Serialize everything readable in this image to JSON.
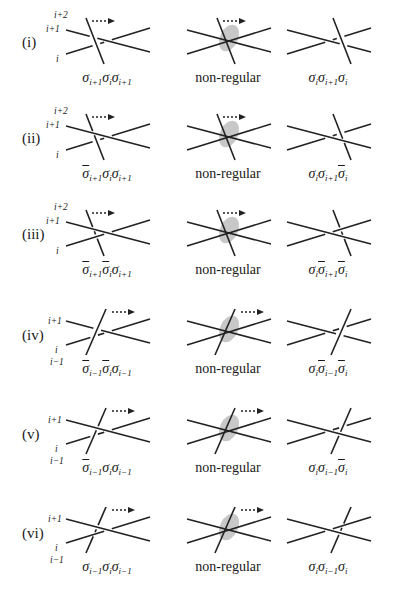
{
  "figure": {
    "columns": [
      "before",
      "non-regular",
      "after"
    ],
    "rows": [
      {
        "id": "i",
        "label": "(i)",
        "strand_labels": [
          "i+2",
          "i+1",
          "i"
        ],
        "left_word": [
          {
            "s": "σ",
            "sub": "i+1",
            "bar": false
          },
          {
            "s": "σ",
            "sub": "i",
            "bar": false
          },
          {
            "s": "σ",
            "sub": "i+1",
            "bar": false
          }
        ],
        "middle_caption": "non-regular",
        "right_word": [
          {
            "s": "σ",
            "sub": "i",
            "bar": false
          },
          {
            "s": "σ",
            "sub": "i+1",
            "bar": false
          },
          {
            "s": "σ",
            "sub": "i",
            "bar": false
          }
        ],
        "moving_strand": "descending",
        "moving_over_top": true,
        "moving_over_bottom": true
      },
      {
        "id": "ii",
        "label": "(ii)",
        "strand_labels": [
          "i+2",
          "i+1",
          "i"
        ],
        "left_word": [
          {
            "s": "σ",
            "sub": "i+1",
            "bar": true
          },
          {
            "s": "σ",
            "sub": "i",
            "bar": false
          },
          {
            "s": "σ",
            "sub": "i+1",
            "bar": false
          }
        ],
        "middle_caption": "non-regular",
        "right_word": [
          {
            "s": "σ",
            "sub": "i",
            "bar": false
          },
          {
            "s": "σ",
            "sub": "i+1",
            "bar": false
          },
          {
            "s": "σ",
            "sub": "i",
            "bar": true
          }
        ],
        "moving_strand": "descending",
        "moving_over_top": false,
        "moving_over_bottom": true
      },
      {
        "id": "iii",
        "label": "(iii)",
        "strand_labels": [
          "i+2",
          "i+1",
          "i"
        ],
        "left_word": [
          {
            "s": "σ",
            "sub": "i+1",
            "bar": true
          },
          {
            "s": "σ",
            "sub": "i",
            "bar": true
          },
          {
            "s": "σ",
            "sub": "i+1",
            "bar": false
          }
        ],
        "middle_caption": "non-regular",
        "right_word": [
          {
            "s": "σ",
            "sub": "i",
            "bar": false
          },
          {
            "s": "σ",
            "sub": "i+1",
            "bar": true
          },
          {
            "s": "σ",
            "sub": "i",
            "bar": true
          }
        ],
        "moving_strand": "descending",
        "moving_over_top": false,
        "moving_over_bottom": false
      },
      {
        "id": "iv",
        "label": "(iv)",
        "strand_labels": [
          "i+1",
          "i",
          "i−1"
        ],
        "left_word": [
          {
            "s": "σ",
            "sub": "i−1",
            "bar": true
          },
          {
            "s": "σ",
            "sub": "i",
            "bar": true
          },
          {
            "s": "σ",
            "sub": "i−1",
            "bar": false
          }
        ],
        "middle_caption": "non-regular",
        "right_word": [
          {
            "s": "σ",
            "sub": "i",
            "bar": false
          },
          {
            "s": "σ",
            "sub": "i−1",
            "bar": true
          },
          {
            "s": "σ",
            "sub": "i",
            "bar": true
          }
        ],
        "moving_strand": "ascending",
        "moving_over_top": true,
        "moving_over_bottom": true
      },
      {
        "id": "v",
        "label": "(v)",
        "strand_labels": [
          "i+1",
          "i",
          "i−1"
        ],
        "left_word": [
          {
            "s": "σ",
            "sub": "i−1",
            "bar": true
          },
          {
            "s": "σ",
            "sub": "i",
            "bar": false
          },
          {
            "s": "σ",
            "sub": "i−1",
            "bar": false
          }
        ],
        "middle_caption": "non-regular",
        "right_word": [
          {
            "s": "σ",
            "sub": "i",
            "bar": false
          },
          {
            "s": "σ",
            "sub": "i−1",
            "bar": false
          },
          {
            "s": "σ",
            "sub": "i",
            "bar": true
          }
        ],
        "moving_strand": "ascending",
        "moving_over_top": false,
        "moving_over_bottom": true
      },
      {
        "id": "vi",
        "label": "(vi)",
        "strand_labels": [
          "i+1",
          "i",
          "i−1"
        ],
        "left_word": [
          {
            "s": "σ",
            "sub": "i−1",
            "bar": false
          },
          {
            "s": "σ",
            "sub": "i",
            "bar": false
          },
          {
            "s": "σ",
            "sub": "i−1",
            "bar": false
          }
        ],
        "middle_caption": "non-regular",
        "right_word": [
          {
            "s": "σ",
            "sub": "i",
            "bar": false
          },
          {
            "s": "σ",
            "sub": "i−1",
            "bar": false
          },
          {
            "s": "σ",
            "sub": "i",
            "bar": false
          }
        ],
        "moving_strand": "ascending",
        "moving_over_top": false,
        "moving_over_bottom": false
      }
    ],
    "colors": {
      "stroke": "#222222",
      "highlight": "#c8c8c8",
      "background": "#ffffff"
    }
  }
}
